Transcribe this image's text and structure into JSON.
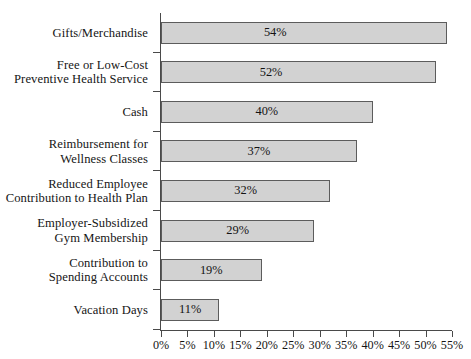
{
  "chart_data": {
    "type": "bar",
    "orientation": "horizontal",
    "title": "",
    "subtitle": "",
    "xlabel": "",
    "ylabel": "",
    "categories": [
      "Gifts/Merchandise",
      "Free or Low-Cost Preventive Health Service",
      "Cash",
      "Reimbursement for Wellness Classes",
      "Reduced Employee Contribution to Health Plan",
      "Employer-Subsidized Gym Membership",
      "Contribution to Spending Accounts",
      "Vacation Days"
    ],
    "category_lines": [
      [
        "Gifts/Merchandise"
      ],
      [
        "Free or Low-Cost",
        "Preventive Health Service"
      ],
      [
        "Cash"
      ],
      [
        "Reimbursement for",
        "Wellness Classes"
      ],
      [
        "Reduced Employee",
        "Contribution to Health Plan"
      ],
      [
        "Employer-Subsidized",
        "Gym Membership"
      ],
      [
        "Contribution to",
        "Spending Accounts"
      ],
      [
        "Vacation Days"
      ]
    ],
    "values": [
      54,
      52,
      40,
      37,
      32,
      29,
      19,
      11
    ],
    "data_labels": [
      "54%",
      "52%",
      "40%",
      "37%",
      "32%",
      "29%",
      "19%",
      "11%"
    ],
    "xlim": [
      0,
      55
    ],
    "xticks": [
      0,
      5,
      10,
      15,
      20,
      25,
      30,
      35,
      40,
      45,
      50,
      55
    ],
    "xtick_labels": [
      "0%",
      "5%",
      "10%",
      "15%",
      "20%",
      "25%",
      "30%",
      "35%",
      "40%",
      "45%",
      "50%",
      "55%"
    ],
    "grid": false,
    "legend": false,
    "legend_position": "none",
    "bar_fill_color": "#d2d2d2",
    "bar_border_color": "#5c5c5c",
    "axis_color": "#4a4a4a",
    "background_color": "#ffffff",
    "text_color": "#141414"
  }
}
